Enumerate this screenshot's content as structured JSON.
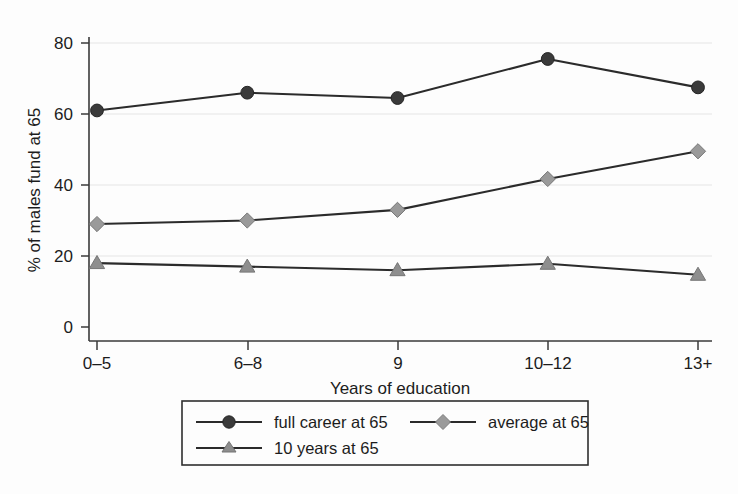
{
  "chart_data": {
    "type": "line",
    "title": "",
    "subtitle": "",
    "xlabel": "Years of education",
    "ylabel": "% of males fund at 65",
    "categories": [
      "0–5",
      "6–8",
      "9",
      "10–12",
      "13+"
    ],
    "ylim": [
      0,
      80
    ],
    "yticks": [
      0,
      20,
      40,
      60,
      80
    ],
    "ytick_labels": [
      "0",
      "20",
      "40",
      "60",
      "80"
    ],
    "grid": "horizontal",
    "legend_position": "bottom",
    "series": [
      {
        "name": "full career at 65",
        "marker": "circle",
        "color": "#3a3a3a",
        "values": [
          61.0,
          66.0,
          64.5,
          75.5,
          67.5
        ]
      },
      {
        "name": "average at 65",
        "marker": "diamond",
        "color": "#9a9a9a",
        "values": [
          29.0,
          30.0,
          33.0,
          41.7,
          49.5
        ]
      },
      {
        "name": "10 years at 65",
        "marker": "triangle",
        "color": "#8e8e8e",
        "values": [
          18.0,
          17.0,
          16.0,
          17.8,
          14.7
        ]
      }
    ]
  },
  "axes": {
    "y_title": "% of males fund at 65",
    "x_title": "Years of education",
    "y_tick_0": "0",
    "y_tick_1": "20",
    "y_tick_2": "40",
    "y_tick_3": "60",
    "y_tick_4": "80",
    "x_tick_0": "0–5",
    "x_tick_1": "6–8",
    "x_tick_2": "9",
    "x_tick_3": "10–12",
    "x_tick_4": "13+"
  },
  "legend": {
    "entry_0": "full career at 65",
    "entry_1": "average at 65",
    "entry_2": "10 years at 65"
  },
  "colors": {
    "series_full_career": "#3a3a3a",
    "series_average": "#9a9a9a",
    "series_ten_years": "#8e8e8e",
    "axis": "#3a3a3a",
    "grid": "#ececec",
    "background": "#fdfdfd"
  }
}
